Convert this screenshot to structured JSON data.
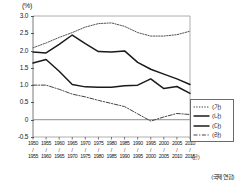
{
  "chart_data": {
    "type": "line",
    "title": "",
    "subtitle": "",
    "unit_label": "(%)",
    "xlabel": "(년)",
    "ylabel": "(%)",
    "source": "(국제 연합)",
    "grid": false,
    "legend_position": "right-bottom",
    "ylim": [
      -0.5,
      3.0
    ],
    "yticks": [
      "3.0",
      "2.5",
      "2.0",
      "1.5",
      "1.0",
      "0.5",
      "0",
      "-0.5"
    ],
    "ytick_values": [
      3.0,
      2.5,
      2.0,
      1.5,
      1.0,
      0.5,
      0.0,
      -0.5
    ],
    "x_start_labels": [
      "1950",
      "1955",
      "1960",
      "1965",
      "1970",
      "1975",
      "1980",
      "1985",
      "1990",
      "1995",
      "2000",
      "2005",
      "2010"
    ],
    "x_end_labels": [
      "1955",
      "1960",
      "1965",
      "1970",
      "1975",
      "1980",
      "1985",
      "1990",
      "1995",
      "2000",
      "2005",
      "2010",
      "2015"
    ],
    "x_separator": "/",
    "x_unit_suffix": "(년)",
    "categories": [
      "1950/1955",
      "1955/1960",
      "1960/1965",
      "1965/1970",
      "1970/1975",
      "1975/1980",
      "1980/1985",
      "1985/1990",
      "1990/1995",
      "1995/2000",
      "2000/2005",
      "2005/2010",
      "2010/2015"
    ],
    "series": [
      {
        "name": "(가)",
        "style": "dotted",
        "color": "#555555",
        "values": [
          2.08,
          2.22,
          2.38,
          2.52,
          2.68,
          2.78,
          2.8,
          2.7,
          2.52,
          2.42,
          2.42,
          2.46,
          2.56
        ]
      },
      {
        "name": "(나)",
        "style": "solid",
        "color": "#1a1a1a",
        "values": [
          1.96,
          1.93,
          2.18,
          2.45,
          2.2,
          1.97,
          1.96,
          1.99,
          1.66,
          1.46,
          1.32,
          1.18,
          1.02
        ]
      },
      {
        "name": "(다)",
        "style": "solid",
        "color": "#1a1a1a",
        "values": [
          1.64,
          1.74,
          1.4,
          1.02,
          0.95,
          0.94,
          0.94,
          0.98,
          1.0,
          1.18,
          0.9,
          0.96,
          0.76
        ]
      },
      {
        "name": "(라)",
        "style": "dashdot",
        "color": "#444444",
        "values": [
          1.0,
          1.0,
          0.88,
          0.74,
          0.66,
          0.56,
          0.47,
          0.38,
          0.17,
          -0.04,
          0.08,
          0.18,
          0.15
        ]
      }
    ]
  },
  "legend": {
    "items": [
      {
        "label": "(가)",
        "style": "dotted"
      },
      {
        "label": "(나)",
        "style": "solid"
      },
      {
        "label": "(다)",
        "style": "solid"
      },
      {
        "label": "(라)",
        "style": "dashdot"
      }
    ]
  }
}
